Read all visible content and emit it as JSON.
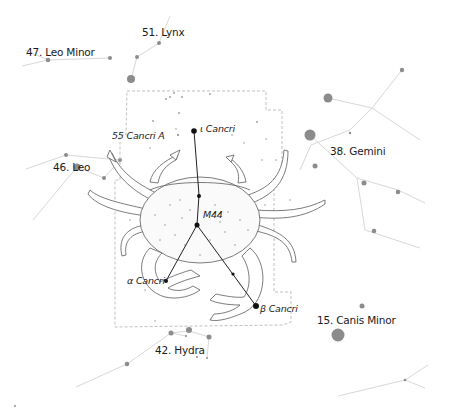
{
  "diagram": {
    "colors": {
      "background": "#ffffff",
      "neighbor_line": "#d6d6d6",
      "neighbor_star": "#8a8a8a",
      "cancer_line": "#222222",
      "cancer_star": "#111111",
      "boundary": "#b4b4b4",
      "crab_outline": "#555555",
      "label": "#1a1a1a"
    },
    "neighbor_constellations": [
      {
        "label": "47. Leo Minor",
        "x": 20,
        "y": 46
      },
      {
        "label": "51. Lynx",
        "x": 142,
        "y": 26
      },
      {
        "label": "46. Leo",
        "x": 53,
        "y": 159
      },
      {
        "label": "38. Gemini",
        "x": 330,
        "y": 143
      },
      {
        "label": "15. Canis Minor",
        "x": 317,
        "y": 313
      },
      {
        "label": "42. Hydra",
        "x": 154,
        "y": 343
      }
    ],
    "cancer_stars": [
      {
        "label": "ι Cancri",
        "x": 200,
        "y": 124
      },
      {
        "label": "55 Cancri A",
        "x": 112,
        "y": 131
      },
      {
        "label": "M44",
        "x": 203,
        "y": 210
      },
      {
        "label": "α Cancri",
        "x": 127,
        "y": 276
      },
      {
        "label": "β Cancri",
        "x": 260,
        "y": 303
      }
    ]
  }
}
